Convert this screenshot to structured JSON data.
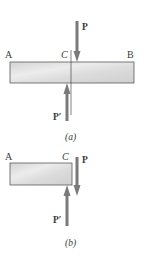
{
  "figure_a": {
    "caption": "(a)",
    "labels": {
      "A": "A",
      "C": "C",
      "B": "B",
      "P": "P",
      "P_prime": "P′"
    },
    "bar": {
      "x": 10,
      "y": 62,
      "width": 124,
      "height": 21
    },
    "arrow_P": {
      "x": 77,
      "y1": 21,
      "y2": 62,
      "direction": "down"
    },
    "arrow_P_prime": {
      "x": 67,
      "y1": 120,
      "y2": 83,
      "direction": "up"
    },
    "section_line": {
      "x": 71,
      "y1": 50,
      "y2": 115
    }
  },
  "figure_b": {
    "caption": "(b)",
    "labels": {
      "A": "A",
      "C": "C",
      "P": "P",
      "P_prime": "P′"
    },
    "bar": {
      "x": 10,
      "y": 163,
      "width": 62,
      "height": 22
    },
    "arrow_P": {
      "x": 77,
      "y1": 157,
      "y2": 196,
      "direction": "down"
    },
    "arrow_P_prime": {
      "x": 67,
      "y1": 226,
      "y2": 185,
      "direction": "up"
    }
  },
  "colors": {
    "bar_fill_light": "#e6e6e6",
    "bar_fill_dark": "#c9c9c9",
    "bar_stroke": "#5a5a5a",
    "arrow": "#7a7a7a",
    "text": "#3a3a3a"
  }
}
